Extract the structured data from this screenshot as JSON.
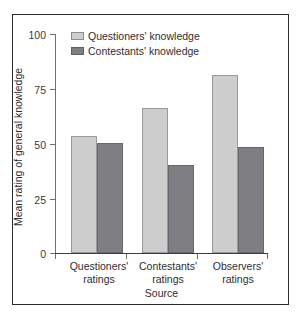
{
  "chart_data": {
    "type": "bar",
    "title": "",
    "xlabel": "Source",
    "ylabel": "Mean rating of general knowledge",
    "categories": [
      "Questioners'\nratings",
      "Contestants'\nratings",
      "Observers'\nratings"
    ],
    "category_labels": [
      {
        "line1": "Questioners'",
        "line2": "ratings"
      },
      {
        "line1": "Contestants'",
        "line2": "ratings"
      },
      {
        "line1": "Observers'",
        "line2": "ratings"
      }
    ],
    "series": [
      {
        "name": "Questioners' knowledge",
        "color": "#cdcdcd",
        "values": [
          53,
          66,
          81
        ]
      },
      {
        "name": "Contestants' knowledge",
        "color": "#7f7f83",
        "values": [
          50,
          40,
          48
        ]
      }
    ],
    "ylim": [
      0,
      100
    ],
    "yticks": [
      0,
      25,
      50,
      75,
      100
    ],
    "ytick_labels": [
      "0",
      "25",
      "50",
      "75",
      "100"
    ],
    "grid": false,
    "legend_position": "top-left-inside"
  },
  "legend": {
    "items": [
      {
        "label": "Questioners' knowledge",
        "swatch": "light"
      },
      {
        "label": "Contestants' knowledge",
        "swatch": "dark"
      }
    ]
  },
  "axes": {
    "y_title": "Mean rating of general knowledge",
    "x_title": "Source",
    "y_tick_0": "0",
    "y_tick_25": "25",
    "y_tick_50": "50",
    "y_tick_75": "75",
    "y_tick_100": "100"
  }
}
